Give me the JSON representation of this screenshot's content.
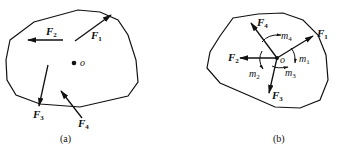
{
  "diagram": {
    "type": "force-system-reduction",
    "panels": [
      {
        "caption": "(a)",
        "point": "o",
        "forces": [
          {
            "name": "F",
            "sub": "1"
          },
          {
            "name": "F",
            "sub": "2"
          },
          {
            "name": "F",
            "sub": "3"
          },
          {
            "name": "F",
            "sub": "4"
          }
        ]
      },
      {
        "caption": "(b)",
        "point": "o",
        "forces": [
          {
            "name": "F",
            "sub": "1"
          },
          {
            "name": "F",
            "sub": "2"
          },
          {
            "name": "F",
            "sub": "3"
          },
          {
            "name": "F",
            "sub": "4"
          }
        ],
        "moments": [
          {
            "name": "m",
            "sub": "1"
          },
          {
            "name": "m",
            "sub": "2"
          },
          {
            "name": "m",
            "sub": "3"
          },
          {
            "name": "m",
            "sub": "4"
          }
        ]
      }
    ],
    "colors": {
      "ink": "#111111",
      "background": "#ffffff"
    }
  }
}
